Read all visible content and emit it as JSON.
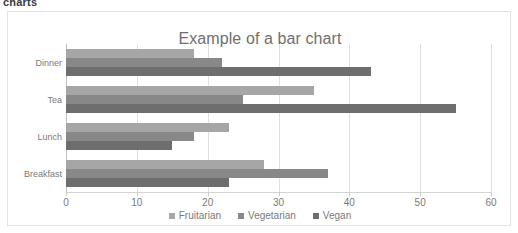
{
  "page": {
    "heading": "charts"
  },
  "chart_data": {
    "type": "bar",
    "orientation": "horizontal",
    "title": "Example of a bar chart",
    "xlabel": "",
    "ylabel": "",
    "xlim": [
      0,
      60
    ],
    "xticks": [
      0,
      10,
      20,
      30,
      40,
      50,
      60
    ],
    "xtick_labels": [
      "0",
      "10",
      "20",
      "30",
      "40",
      "50",
      "60"
    ],
    "grid": true,
    "grid_axis": "x",
    "legend_position": "bottom",
    "categories": [
      "Breakfast",
      "Lunch",
      "Tea",
      "Dinner"
    ],
    "categories_display_top_to_bottom": [
      "Dinner",
      "Tea",
      "Lunch",
      "Breakfast"
    ],
    "series": [
      {
        "name": "Fruitarian",
        "color": "#a6a6a6",
        "values": [
          28,
          23,
          35,
          18
        ]
      },
      {
        "name": "Vegetarian",
        "color": "#888888",
        "values": [
          37,
          18,
          25,
          22
        ]
      },
      {
        "name": "Vegan",
        "color": "#6e6e6e",
        "values": [
          23,
          15,
          55,
          43
        ]
      }
    ],
    "legend": [
      {
        "label": "Fruitarian",
        "color": "#a6a6a6"
      },
      {
        "label": "Vegetarian",
        "color": "#888888"
      },
      {
        "label": "Vegan",
        "color": "#6e6e6e"
      }
    ]
  }
}
